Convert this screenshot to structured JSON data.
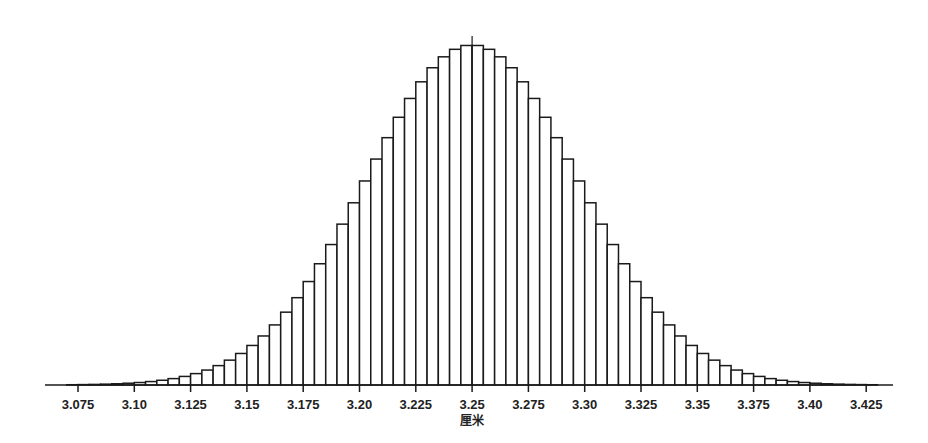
{
  "chart_data": {
    "type": "bar",
    "subtype": "histogram",
    "title": "",
    "xlabel": "厘米",
    "ylabel": "",
    "bin_width": 0.005,
    "bin_start": 3.07,
    "bin_end": 3.43,
    "value_scale": "relative (peak = 1)",
    "center_marker": 3.25,
    "xlim": [
      3.06,
      3.44
    ],
    "ylim": [
      0,
      1.0
    ],
    "grid": false,
    "legend": null,
    "x_ticks": [
      3.075,
      3.1,
      3.125,
      3.15,
      3.175,
      3.2,
      3.225,
      3.25,
      3.275,
      3.3,
      3.325,
      3.35,
      3.375,
      3.4,
      3.425
    ],
    "x_tick_labels": [
      "3.075",
      "3.10",
      "3.125",
      "3.15",
      "3.175",
      "3.20",
      "3.225",
      "3.25",
      "3.275",
      "3.30",
      "3.325",
      "3.35",
      "3.375",
      "3.40",
      "3.425"
    ],
    "categories": [
      "3.070-3.075",
      "3.075-3.080",
      "3.080-3.085",
      "3.085-3.090",
      "3.090-3.095",
      "3.095-3.100",
      "3.100-3.105",
      "3.105-3.110",
      "3.110-3.115",
      "3.115-3.120",
      "3.120-3.125",
      "3.125-3.130",
      "3.130-3.135",
      "3.135-3.140",
      "3.140-3.145",
      "3.145-3.150",
      "3.150-3.155",
      "3.155-3.160",
      "3.160-3.165",
      "3.165-3.170",
      "3.170-3.175",
      "3.175-3.180",
      "3.180-3.185",
      "3.185-3.190",
      "3.190-3.195",
      "3.195-3.200",
      "3.200-3.205",
      "3.205-3.210",
      "3.210-3.215",
      "3.215-3.220",
      "3.220-3.225",
      "3.225-3.230",
      "3.230-3.235",
      "3.235-3.240",
      "3.240-3.245",
      "3.245-3.250",
      "3.250-3.255",
      "3.255-3.260",
      "3.260-3.265",
      "3.265-3.270",
      "3.270-3.275",
      "3.275-3.280",
      "3.280-3.285",
      "3.285-3.290",
      "3.290-3.295",
      "3.295-3.300",
      "3.300-3.305",
      "3.305-3.310",
      "3.310-3.315",
      "3.315-3.320",
      "3.320-3.325",
      "3.325-3.330",
      "3.330-3.335",
      "3.335-3.340",
      "3.340-3.345",
      "3.345-3.350",
      "3.350-3.355",
      "3.355-3.360",
      "3.360-3.365",
      "3.365-3.370",
      "3.370-3.375",
      "3.375-3.380",
      "3.380-3.385",
      "3.385-3.390",
      "3.390-3.395",
      "3.395-3.400",
      "3.400-3.405",
      "3.405-3.410",
      "3.410-3.415",
      "3.415-3.420",
      "3.420-3.425",
      "3.425-3.430"
    ],
    "values": [
      0.0008,
      0.0012,
      0.0017,
      0.0025,
      0.0036,
      0.0052,
      0.0073,
      0.0101,
      0.0139,
      0.0188,
      0.0252,
      0.0335,
      0.0439,
      0.057,
      0.0731,
      0.0927,
      0.1163,
      0.1442,
      0.1767,
      0.2142,
      0.2568,
      0.3043,
      0.3566,
      0.4131,
      0.4731,
      0.5359,
      0.6001,
      0.6645,
      0.7274,
      0.7874,
      0.8428,
      0.8917,
      0.9331,
      0.9652,
      0.9873,
      0.9986,
      0.9986,
      0.9873,
      0.9652,
      0.9331,
      0.8917,
      0.8428,
      0.7874,
      0.7274,
      0.6645,
      0.6001,
      0.5359,
      0.4731,
      0.4131,
      0.3566,
      0.3043,
      0.2568,
      0.2142,
      0.1767,
      0.1442,
      0.1163,
      0.0927,
      0.0731,
      0.057,
      0.0439,
      0.0335,
      0.0252,
      0.0188,
      0.0139,
      0.0101,
      0.0073,
      0.0052,
      0.0036,
      0.0025,
      0.0017,
      0.0012,
      0.0008
    ]
  },
  "colors": {
    "bar_fill": "#ffffff",
    "bar_stroke": "#1a1a1a",
    "axis": "#1a1a1a",
    "text": "#222222",
    "background": "#ffffff"
  }
}
